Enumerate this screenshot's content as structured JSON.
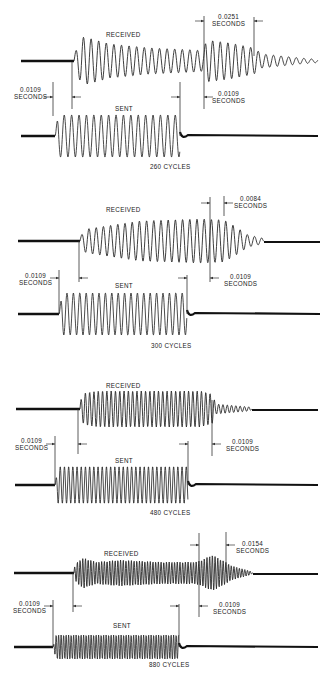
{
  "figure": {
    "colors": {
      "trace": "#2a2a2a",
      "baseline": "#111111",
      "text": "#222222",
      "background": "#ffffff"
    },
    "panels": [
      {
        "cycles_label": "260 CYCLES",
        "received_label": "RECEIVED",
        "sent_label": "SENT",
        "annotations": [
          {
            "value": "0.0109",
            "unit": "SECONDS",
            "position": "left-start"
          },
          {
            "value": "0.0251",
            "unit": "SECONDS",
            "position": "right-top"
          },
          {
            "value": "0.0109",
            "unit": "SECONDS",
            "position": "right-bottom"
          }
        ]
      },
      {
        "cycles_label": "300 CYCLES",
        "received_label": "RECEIVED",
        "sent_label": "SENT",
        "annotations": [
          {
            "value": "0.0109",
            "unit": "SECONDS",
            "position": "left-start"
          },
          {
            "value": "0.0084",
            "unit": "SECONDS",
            "position": "right-top"
          },
          {
            "value": "0.0109",
            "unit": "SECONDS",
            "position": "right-bottom"
          }
        ]
      },
      {
        "cycles_label": "480 CYCLES",
        "received_label": "RECEIVED",
        "sent_label": "SENT",
        "annotations": [
          {
            "value": "0.0109",
            "unit": "SECONDS",
            "position": "left-start"
          },
          {
            "value": "0.0109",
            "unit": "SECONDS",
            "position": "right-bottom"
          }
        ]
      },
      {
        "cycles_label": "880 CYCLES",
        "received_label": "RECEIVED",
        "sent_label": "SENT",
        "annotations": [
          {
            "value": "0.0109",
            "unit": "SECONDS",
            "position": "left-start"
          },
          {
            "value": "0.0154",
            "unit": "SECONDS",
            "position": "right-top"
          },
          {
            "value": "0.0109",
            "unit": "SECONDS",
            "position": "right-bottom"
          }
        ]
      }
    ],
    "geometry": [
      {
        "recv": {
          "y": 61,
          "x0": 21,
          "start": 74,
          "end": 255,
          "xend": 318,
          "period": 7.6,
          "env": [
            [
              74,
              6
            ],
            [
              82,
              24
            ],
            [
              92,
              22
            ],
            [
              110,
              17
            ],
            [
              150,
              13
            ],
            [
              195,
              11
            ],
            [
              204,
              10
            ],
            [
              206,
              21
            ],
            [
              230,
              18
            ],
            [
              254,
              13
            ],
            [
              262,
              7
            ],
            [
              300,
              3
            ],
            [
              318,
              1.5
            ]
          ]
        },
        "sent": {
          "y": 136,
          "x0": 21,
          "start": 55,
          "end": 180,
          "xend": 318,
          "period": 7.4,
          "amp": 21,
          "offset": 0
        },
        "marks": [
          {
            "x": 53,
            "y1": 82,
            "y2": 116
          },
          {
            "x": 72,
            "y1": 62,
            "y2": 109
          },
          {
            "x": 180,
            "y1": 82,
            "y2": 136
          },
          {
            "x": 204,
            "y1": 16,
            "y2": 109
          },
          {
            "x": 254,
            "y1": 17,
            "y2": 56
          }
        ],
        "arrows": [
          {
            "x": 53,
            "y": 97,
            "dir": "right"
          },
          {
            "x": 72,
            "y": 97,
            "dir": "left"
          },
          {
            "x": 180,
            "y": 97,
            "dir": "right"
          },
          {
            "x": 204,
            "y": 21,
            "dir": "right"
          },
          {
            "x": 254,
            "y": 21,
            "dir": "left"
          },
          {
            "x": 204,
            "y": 97,
            "dir": "left"
          }
        ],
        "labels": {
          "received": [
            106,
            31
          ],
          "sent": [
            115,
            105
          ],
          "cycles": [
            150,
            163
          ],
          "ann": [
            [
              15,
              86
            ],
            [
              211,
              13
            ],
            [
              212,
              90
            ]
          ]
        }
      },
      {
        "recv": {
          "y": 241,
          "x0": 18,
          "start": 80,
          "end": 236,
          "xend": 320,
          "period": 7.2,
          "env": [
            [
              80,
              4
            ],
            [
              86,
              12
            ],
            [
              100,
              14
            ],
            [
              140,
              20
            ],
            [
              200,
              22
            ],
            [
              224,
              21
            ],
            [
              236,
              14
            ],
            [
              248,
              6
            ],
            [
              262,
              3
            ],
            [
              264,
              0
            ]
          ]
        },
        "sent": {
          "y": 314,
          "x0": 18,
          "start": 59,
          "end": 187,
          "xend": 320,
          "period": 6.4,
          "amp": 21,
          "offset": 0
        },
        "marks": [
          {
            "x": 59,
            "y1": 270,
            "y2": 314
          },
          {
            "x": 79,
            "y1": 241,
            "y2": 282
          },
          {
            "x": 187,
            "y1": 275,
            "y2": 314
          },
          {
            "x": 210,
            "y1": 197,
            "y2": 282
          },
          {
            "x": 224,
            "y1": 196,
            "y2": 216
          }
        ],
        "arrows": [
          {
            "x": 59,
            "y": 278,
            "dir": "right"
          },
          {
            "x": 79,
            "y": 278,
            "dir": "left"
          },
          {
            "x": 187,
            "y": 278,
            "dir": "right"
          },
          {
            "x": 210,
            "y": 203,
            "dir": "right"
          },
          {
            "x": 224,
            "y": 203,
            "dir": "left"
          },
          {
            "x": 210,
            "y": 278,
            "dir": "left"
          }
        ],
        "labels": {
          "received": [
            106,
            206
          ],
          "sent": [
            115,
            282
          ],
          "cycles": [
            151,
            342
          ],
          "ann": [
            [
              19,
              272
            ],
            [
              234,
              195
            ],
            [
              224,
              273
            ]
          ]
        }
      },
      {
        "recv": {
          "y": 409,
          "x0": 16,
          "start": 80,
          "end": 214,
          "xend": 318,
          "period": 4.3,
          "env": [
            [
              78,
              3
            ],
            [
              84,
              16
            ],
            [
              100,
              18
            ],
            [
              200,
              18
            ],
            [
              212,
              15
            ],
            [
              216,
              5
            ],
            [
              250,
              2
            ],
            [
              252,
              0
            ]
          ]
        },
        "sent": {
          "y": 485,
          "x0": 15,
          "start": 55,
          "end": 188,
          "xend": 318,
          "period": 4.2,
          "amp": 18.5,
          "offset": 0
        },
        "marks": [
          {
            "x": 55,
            "y1": 436,
            "y2": 485
          },
          {
            "x": 78,
            "y1": 409,
            "y2": 454
          },
          {
            "x": 188,
            "y1": 441,
            "y2": 485
          },
          {
            "x": 212,
            "y1": 400,
            "y2": 456
          }
        ],
        "arrows": [
          {
            "x": 55,
            "y": 444,
            "dir": "right"
          },
          {
            "x": 78,
            "y": 444,
            "dir": "left"
          },
          {
            "x": 188,
            "y": 444,
            "dir": "right"
          },
          {
            "x": 212,
            "y": 444,
            "dir": "left"
          }
        ],
        "labels": {
          "received": [
            106,
            382
          ],
          "sent": [
            115,
            457
          ],
          "cycles": [
            150,
            509
          ],
          "ann": [
            [
              15,
              437
            ],
            [
              226,
              438
            ]
          ]
        }
      },
      {
        "recv": {
          "y": 573,
          "x0": 14,
          "start": 74,
          "end": 226,
          "xend": 318,
          "period": 2.7,
          "env": [
            [
              73,
              3
            ],
            [
              78,
              12
            ],
            [
              84,
              15
            ],
            [
              96,
              11
            ],
            [
              120,
              13
            ],
            [
              160,
              11
            ],
            [
              196,
              11
            ],
            [
              204,
              14
            ],
            [
              212,
              18
            ],
            [
              222,
              13
            ],
            [
              232,
              7
            ],
            [
              250,
              2
            ],
            [
              253,
              0
            ]
          ]
        },
        "sent": {
          "y": 647,
          "x0": 14,
          "start": 53,
          "end": 179,
          "xend": 318,
          "period": 2.5,
          "amp": 12,
          "offset": 0
        },
        "marks": [
          {
            "x": 53,
            "y1": 600,
            "y2": 647
          },
          {
            "x": 73,
            "y1": 573,
            "y2": 612
          },
          {
            "x": 179,
            "y1": 604,
            "y2": 647
          },
          {
            "x": 199,
            "y1": 533,
            "y2": 617
          },
          {
            "x": 226,
            "y1": 532,
            "y2": 572
          }
        ],
        "arrows": [
          {
            "x": 53,
            "y": 606,
            "dir": "right"
          },
          {
            "x": 73,
            "y": 606,
            "dir": "left"
          },
          {
            "x": 179,
            "y": 606,
            "dir": "right"
          },
          {
            "x": 199,
            "y": 545,
            "dir": "right"
          },
          {
            "x": 226,
            "y": 545,
            "dir": "left"
          },
          {
            "x": 199,
            "y": 606,
            "dir": "left"
          }
        ],
        "labels": {
          "received": [
            104,
            550
          ],
          "sent": [
            113,
            622
          ],
          "cycles": [
            149,
            661
          ],
          "ann": [
            [
              13,
              600
            ],
            [
              236,
              540
            ],
            [
              213,
              601
            ]
          ]
        }
      }
    ]
  }
}
